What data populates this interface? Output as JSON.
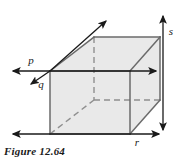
{
  "figure": {
    "caption": "Figure 12.64",
    "type": "geometry-diagram",
    "shape": "rectangular-prism",
    "labels": {
      "p": "p",
      "q": "q",
      "r": "r",
      "s": "s"
    },
    "colors": {
      "face_fill": "#e8e8e8",
      "edge_stroke": "#666666",
      "hidden_edge_stroke": "#999999",
      "arrow_stroke": "#1a1a1a",
      "text": "#1a1a1a",
      "background": "#ffffff"
    },
    "arrows": [
      {
        "name": "p-axis",
        "direction": "horizontal",
        "label": "p"
      },
      {
        "name": "q-axis",
        "direction": "diagonal-down-left",
        "label": "q"
      },
      {
        "name": "r-axis",
        "direction": "horizontal-bottom",
        "label": "r"
      },
      {
        "name": "s-axis",
        "direction": "vertical-right",
        "label": "s"
      },
      {
        "name": "depth-axis",
        "direction": "diagonal-up-right",
        "label": ""
      }
    ]
  }
}
